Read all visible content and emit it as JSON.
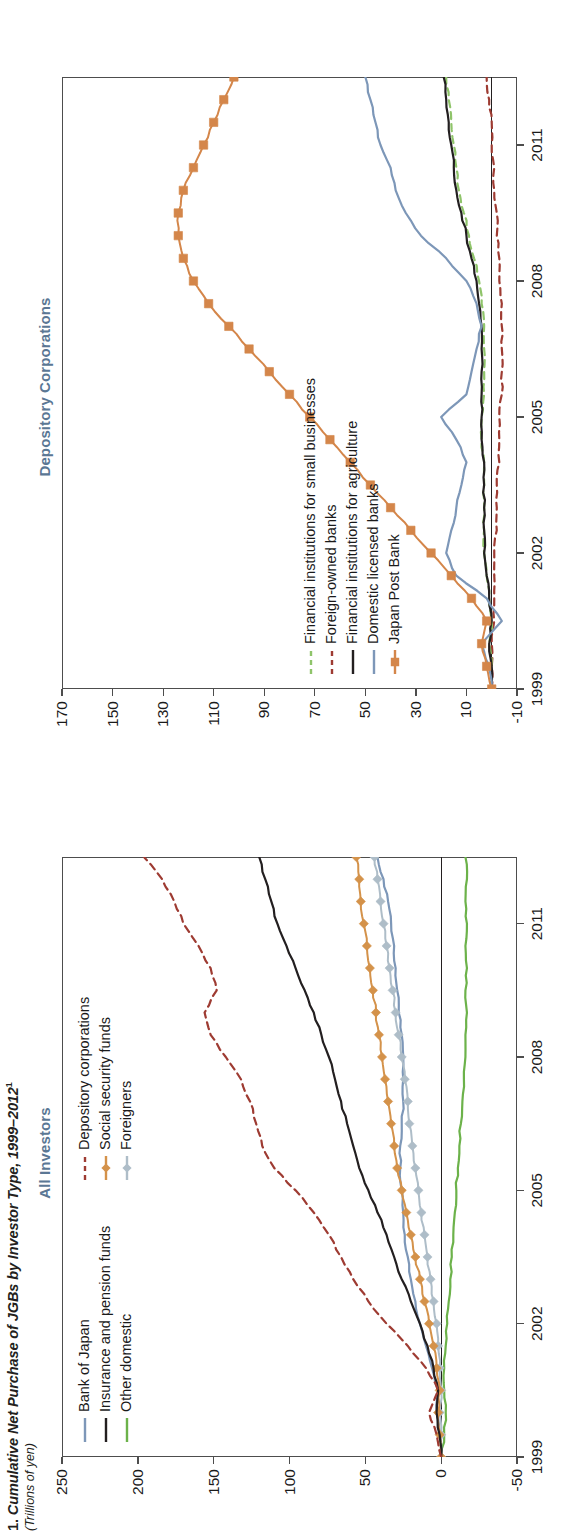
{
  "figure": {
    "number": "1.",
    "title": "Cumulative Net Purchase of JGBs by Investor Type, 1999–2012",
    "footnote_marker": "1",
    "units": "(Trillions of yen)"
  },
  "panels": [
    {
      "id": "all-investors",
      "title": "All Investors",
      "title_color": "#5b7794",
      "legend": [
        {
          "label": "Bank of Japan",
          "color": "#7d97b8",
          "style": "solid",
          "marker": "none"
        },
        {
          "label": "Insurance and pension funds",
          "color": "#231f20",
          "style": "solid",
          "marker": "none"
        },
        {
          "label": "Other domestic",
          "color": "#6cb24a",
          "style": "solid",
          "marker": "none"
        },
        {
          "label": "Depository corporations",
          "color": "#9e3b32",
          "style": "dashed",
          "marker": "none"
        },
        {
          "label": "Social security funds",
          "color": "#d4924a",
          "style": "solid",
          "marker": "diamond"
        },
        {
          "label": "Foreigners",
          "color": "#aebdc8",
          "style": "solid",
          "marker": "diamond"
        }
      ],
      "yaxis": {
        "ticks": [
          250,
          200,
          150,
          100,
          50,
          0,
          -50
        ],
        "min": -50,
        "max": 250
      },
      "xaxis": {
        "ticks": [
          "1999",
          "2002",
          "2005",
          "2008",
          "2011"
        ],
        "min": 1999,
        "max": 2012.5
      }
    },
    {
      "id": "depository-corporations",
      "title": "Depository Corporations",
      "title_color": "#5b7794",
      "legend": [
        {
          "label": "Financial institutions for small businesses",
          "color": "#8fc46a",
          "style": "dashed",
          "marker": "none"
        },
        {
          "label": "Foreign-owned banks",
          "color": "#9e3b32",
          "style": "dashed",
          "marker": "none"
        },
        {
          "label": "Financial institutions for agriculture",
          "color": "#231f20",
          "style": "solid",
          "marker": "none"
        },
        {
          "label": "Domestic licensed banks",
          "color": "#7d97b8",
          "style": "solid",
          "marker": "none"
        },
        {
          "label": "Japan Post Bank",
          "color": "#d4864a",
          "style": "solid",
          "marker": "square"
        }
      ],
      "yaxis": {
        "ticks": [
          170,
          150,
          130,
          110,
          90,
          70,
          50,
          30,
          10,
          -10
        ],
        "min": -10,
        "max": 170
      },
      "xaxis": {
        "ticks": [
          "1999",
          "2002",
          "2005",
          "2008",
          "2011"
        ],
        "min": 1999,
        "max": 2012.5
      }
    }
  ],
  "chart_data": [
    {
      "type": "line",
      "panel": "All Investors",
      "title": "Cumulative Net Purchase of JGBs by Investor Type, 1999–2012 — All Investors",
      "xlabel": "",
      "ylabel": "Trillions of yen",
      "xlim": [
        1999,
        2012.5
      ],
      "ylim": [
        -50,
        250
      ],
      "grid": false,
      "legend_position": "top-left",
      "x": [
        1999,
        1999.5,
        2000,
        2000.5,
        2001,
        2001.5,
        2002,
        2002.5,
        2003,
        2003.5,
        2004,
        2004.5,
        2005,
        2005.5,
        2006,
        2006.5,
        2007,
        2007.5,
        2008,
        2008.5,
        2009,
        2009.5,
        2010,
        2010.5,
        2011,
        2011.5,
        2012,
        2012.5
      ],
      "series": [
        {
          "name": "Depository corporations",
          "color": "#9e3b32",
          "style": "dashed",
          "values": [
            0,
            3,
            8,
            2,
            10,
            22,
            36,
            48,
            58,
            66,
            74,
            84,
            96,
            110,
            118,
            122,
            126,
            132,
            142,
            152,
            156,
            148,
            152,
            160,
            170,
            176,
            184,
            196
          ]
        },
        {
          "name": "Insurance and pension funds",
          "color": "#231f20",
          "style": "solid",
          "values": [
            0,
            1,
            3,
            2,
            5,
            9,
            14,
            20,
            26,
            31,
            36,
            42,
            48,
            54,
            58,
            62,
            66,
            70,
            74,
            79,
            84,
            90,
            96,
            102,
            108,
            112,
            116,
            120
          ]
        },
        {
          "name": "Social security funds",
          "color": "#d4924a",
          "style": "solid",
          "marker": "diamond",
          "values": [
            0,
            1,
            2,
            1,
            3,
            5,
            8,
            11,
            14,
            17,
            20,
            23,
            26,
            29,
            31,
            33,
            35,
            37,
            39,
            41,
            43,
            45,
            47,
            49,
            51,
            53,
            54,
            56
          ]
        },
        {
          "name": "Foreigners",
          "color": "#aebdc8",
          "style": "solid",
          "marker": "diamond",
          "values": [
            0,
            0,
            1,
            0,
            1,
            2,
            3,
            5,
            7,
            9,
            11,
            13,
            15,
            17,
            19,
            21,
            22,
            24,
            26,
            28,
            30,
            32,
            34,
            36,
            38,
            40,
            42,
            44
          ]
        },
        {
          "name": "Bank of Japan",
          "color": "#7d97b8",
          "style": "solid",
          "values": [
            0,
            1,
            3,
            2,
            6,
            10,
            14,
            17,
            20,
            22,
            24,
            25,
            26,
            27,
            27,
            26,
            25,
            25,
            25,
            26,
            28,
            29,
            30,
            31,
            33,
            35,
            38,
            42
          ]
        },
        {
          "name": "Other domestic",
          "color": "#6cb24a",
          "style": "solid",
          "values": [
            0,
            -2,
            -3,
            -2,
            -2,
            -3,
            -4,
            -5,
            -6,
            -7,
            -8,
            -9,
            -10,
            -11,
            -12,
            -13,
            -14,
            -15,
            -16,
            -16,
            -17,
            -16,
            -17,
            -16,
            -17,
            -16,
            -17,
            -16
          ]
        }
      ]
    },
    {
      "type": "line",
      "panel": "Depository Corporations",
      "title": "Cumulative Net Purchase of JGBs by Investor Type, 1999–2012 — Depository Corporations",
      "xlabel": "",
      "ylabel": "Trillions of yen",
      "xlim": [
        1999,
        2012.5
      ],
      "ylim": [
        -10,
        170
      ],
      "grid": false,
      "legend_position": "bottom-left",
      "x": [
        1999,
        1999.5,
        2000,
        2000.5,
        2001,
        2001.5,
        2002,
        2002.5,
        2003,
        2003.5,
        2004,
        2004.5,
        2005,
        2005.5,
        2006,
        2006.5,
        2007,
        2007.5,
        2008,
        2008.5,
        2009,
        2009.5,
        2010,
        2010.5,
        2011,
        2011.5,
        2012,
        2012.5
      ],
      "series": [
        {
          "name": "Japan Post Bank",
          "color": "#d4864a",
          "style": "solid",
          "marker": "square",
          "values": [
            0,
            2,
            4,
            2,
            8,
            16,
            24,
            32,
            40,
            48,
            56,
            64,
            72,
            80,
            88,
            96,
            104,
            112,
            118,
            122,
            124,
            124,
            122,
            118,
            114,
            110,
            106,
            102
          ]
        },
        {
          "name": "Domestic licensed banks",
          "color": "#7d97b8",
          "style": "solid",
          "values": [
            0,
            1,
            4,
            -4,
            2,
            14,
            18,
            16,
            14,
            12,
            10,
            14,
            20,
            10,
            8,
            6,
            4,
            6,
            10,
            18,
            28,
            34,
            38,
            40,
            44,
            46,
            48,
            50
          ]
        },
        {
          "name": "Financial institutions for agriculture",
          "color": "#231f20",
          "style": "solid",
          "values": [
            0,
            0,
            1,
            0,
            1,
            2,
            3,
            3,
            3,
            3,
            3,
            4,
            4,
            4,
            4,
            4,
            4,
            5,
            6,
            8,
            10,
            12,
            14,
            15,
            16,
            17,
            18,
            19
          ]
        },
        {
          "name": "Financial institutions for small businesses",
          "color": "#8fc46a",
          "style": "dashed",
          "values": [
            0,
            0,
            1,
            0,
            1,
            2,
            3,
            3,
            3,
            3,
            3,
            4,
            4,
            3,
            3,
            3,
            3,
            4,
            5,
            7,
            9,
            11,
            13,
            14,
            15,
            16,
            17,
            18
          ]
        },
        {
          "name": "Foreign-owned banks",
          "color": "#9e3b32",
          "style": "dashed",
          "values": [
            0,
            0,
            0,
            -1,
            -1,
            -1,
            -1,
            -2,
            -2,
            -2,
            -3,
            -3,
            -3,
            -4,
            -4,
            -4,
            -4,
            -4,
            -3,
            -3,
            -2,
            -2,
            -1,
            -1,
            0,
            0,
            1,
            2
          ]
        }
      ]
    }
  ]
}
